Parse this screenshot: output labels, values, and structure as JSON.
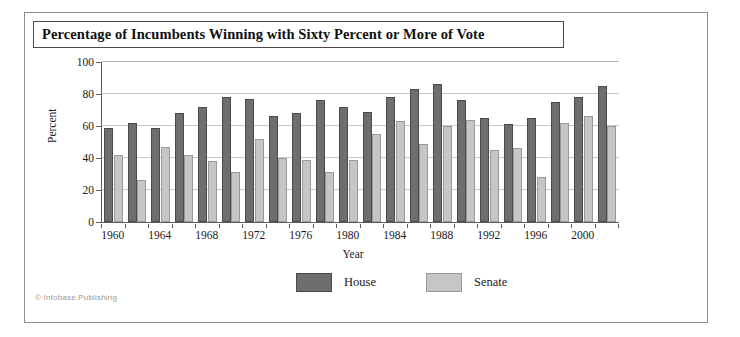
{
  "figure": {
    "title": "Percentage of Incumbents Winning with Sixty Percent or More of Vote",
    "credit": "© Infobase Publishing"
  },
  "chart_data": {
    "type": "bar",
    "title": "Percentage of Incumbents Winning with Sixty Percent or More of Vote",
    "xlabel": "Year",
    "ylabel": "Percent",
    "ylim": [
      0,
      100
    ],
    "yticks": [
      0,
      20,
      40,
      60,
      80,
      100
    ],
    "grid": true,
    "legend_position": "bottom-center",
    "categories": [
      "1960",
      "1962",
      "1964",
      "1966",
      "1968",
      "1970",
      "1972",
      "1974",
      "1976",
      "1978",
      "1980",
      "1982",
      "1984",
      "1986",
      "1988",
      "1990",
      "1992",
      "1994",
      "1996",
      "1998",
      "2000",
      "2002"
    ],
    "tick_categories": [
      "1960",
      "1964",
      "1968",
      "1972",
      "1976",
      "1980",
      "1984",
      "1988",
      "1992",
      "1996",
      "2000"
    ],
    "series": [
      {
        "name": "House",
        "color": "#6e6e6e",
        "values": [
          59,
          62,
          59,
          68,
          72,
          78,
          77,
          66,
          68,
          76,
          72,
          69,
          78,
          83,
          86,
          76,
          65,
          61,
          65,
          75,
          78,
          85
        ]
      },
      {
        "name": "Senate",
        "color": "#c6c6c6",
        "values": [
          42,
          26,
          47,
          42,
          38,
          31,
          52,
          40,
          39,
          31,
          39,
          55,
          63,
          49,
          60,
          64,
          45,
          46,
          28,
          62,
          66,
          60
        ]
      }
    ]
  }
}
